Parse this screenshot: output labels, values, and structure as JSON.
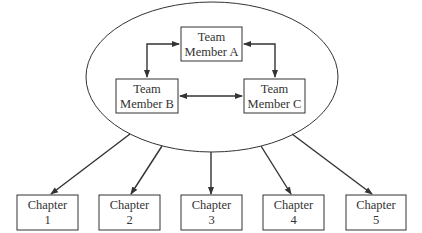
{
  "diagram": {
    "type": "team-to-chapters",
    "colors": {
      "background": "#ffffff",
      "stroke": "#333333",
      "text": "#333333"
    },
    "team_group": {
      "shape": "ellipse",
      "members": [
        {
          "id": "A",
          "line1": "Team",
          "line2": "Member A"
        },
        {
          "id": "B",
          "line1": "Team",
          "line2": "Member B"
        },
        {
          "id": "C",
          "line1": "Team",
          "line2": "Member C"
        }
      ],
      "connections": [
        {
          "from": "A",
          "to": "B",
          "bidirectional": true
        },
        {
          "from": "A",
          "to": "C",
          "bidirectional": true
        },
        {
          "from": "B",
          "to": "C",
          "bidirectional": true
        }
      ]
    },
    "chapters": [
      {
        "line1": "Chapter",
        "line2": "1"
      },
      {
        "line1": "Chapter",
        "line2": "2"
      },
      {
        "line1": "Chapter",
        "line2": "3"
      },
      {
        "line1": "Chapter",
        "line2": "4"
      },
      {
        "line1": "Chapter",
        "line2": "5"
      }
    ],
    "group_to_chapter_arrows": 5
  }
}
